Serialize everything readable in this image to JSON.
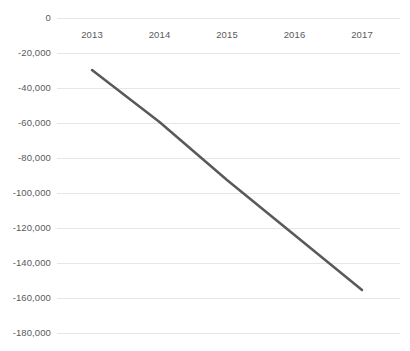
{
  "chart_data": {
    "type": "line",
    "title": "",
    "subtitle": "",
    "xlabel": "",
    "ylabel": "",
    "categories": [
      "2013",
      "2014",
      "2015",
      "2016",
      "2017"
    ],
    "series": [
      {
        "name": "",
        "values": [
          -29700,
          -59400,
          -92600,
          -124000,
          -155400
        ],
        "color": "#595959",
        "line_width": 2.5,
        "markers": false
      }
    ],
    "ylim": [
      -180000,
      0
    ],
    "yticks": [
      0,
      -20000,
      -40000,
      -60000,
      -80000,
      -100000,
      -120000,
      -140000,
      -160000,
      -180000
    ],
    "ytick_labels": [
      "0",
      "-20,000",
      "-40,000",
      "-60,000",
      "-80,000",
      "-100,000",
      "-120,000",
      "-140,000",
      "-160,000",
      "-180,000"
    ],
    "grid": true,
    "grid_color": "#e6e6e6",
    "legend": false,
    "legend_position": "none",
    "background": "#ffffff",
    "tick_label_color": "#5a5a5a"
  }
}
